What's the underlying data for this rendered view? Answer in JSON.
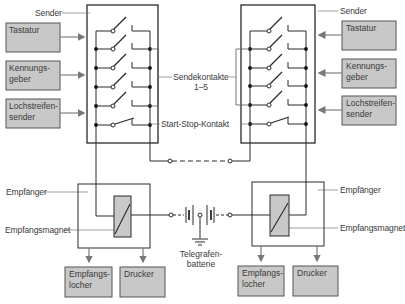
{
  "colors": {
    "line": "#2a2a2a",
    "box_fill": "#c8c8c8",
    "box_stroke": "#555555",
    "label_line": "#777777",
    "text": "#3a3a3a"
  },
  "labels": {
    "sender_left": "Sender",
    "sender_right": "Sender",
    "sendekontakte": "Sendekontakte",
    "sendekontakte_range": "1–5",
    "start_stop": "Start-Stop-Kontakt",
    "empfaenger_left": "Empfänger",
    "empfaenger_right": "Empfänger",
    "magnet_left": "Empfangsmagnet",
    "magnet_right": "Empfangsmagnet",
    "battery": "Telegrafen-\nbatterie"
  },
  "input_boxes_left": [
    {
      "label": "Tastatur"
    },
    {
      "label": "Kennungs-\ngeber"
    },
    {
      "label": "Lochstreifen-\nsender"
    }
  ],
  "input_boxes_right": [
    {
      "label": "Tastatur"
    },
    {
      "label": "Kennungs-\ngeber"
    },
    {
      "label": "Lochstreifen-\nsender"
    }
  ],
  "output_boxes_left": [
    {
      "label": "Empfangs-\nlocher"
    },
    {
      "label": "Drucker"
    }
  ],
  "output_boxes_right": [
    {
      "label": "Empfangs-\nlocher"
    },
    {
      "label": "Drucker"
    }
  ],
  "icons": {
    "switch": "open-switch-icon",
    "battery": "battery-icon",
    "ground": "ground-icon",
    "magnet": "relay-magnet-icon",
    "arrow": "arrow-icon"
  }
}
